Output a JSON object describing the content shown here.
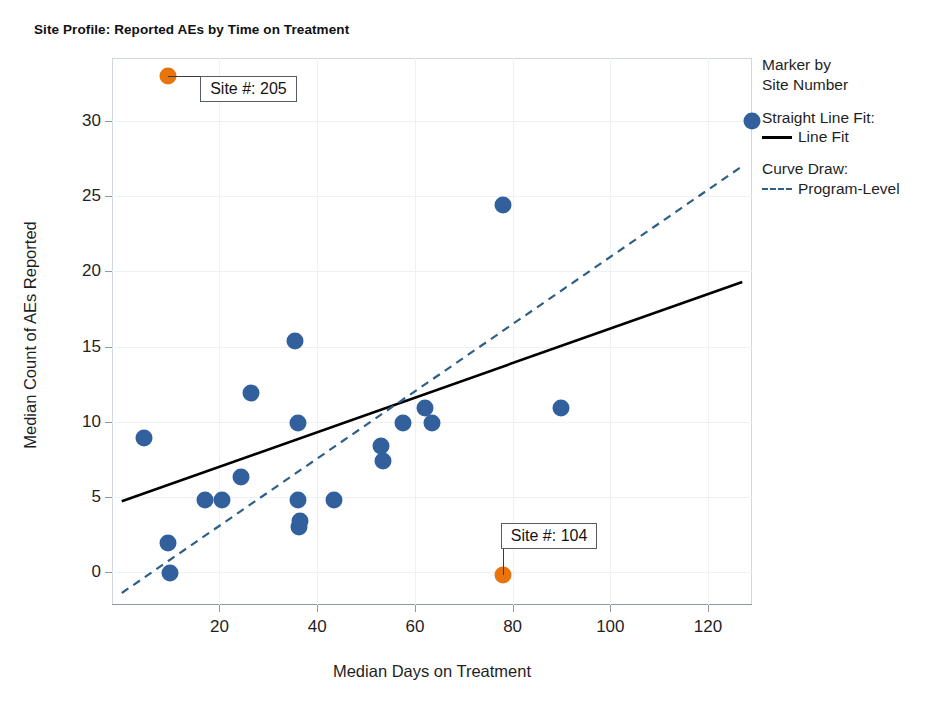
{
  "chart_data": {
    "type": "scatter",
    "title": "Site Profile: Reported AEs by Time on Treatment",
    "xlabel": "Median Days on Treatment",
    "ylabel": "Median Count of AEs Reported",
    "xlim": [
      -2,
      129
    ],
    "ylim": [
      -2.2,
      34.2
    ],
    "xticks": [
      20,
      40,
      60,
      80,
      100,
      120
    ],
    "yticks": [
      0,
      5,
      10,
      15,
      20,
      25,
      30
    ],
    "grid": true,
    "legend_position": "right",
    "colors": {
      "marker_default": "#31609D",
      "marker_highlight": "#E8740C",
      "line_fit": "#000000",
      "program_level": "#2F5F86",
      "grid": "#EEF1F4",
      "axis": "#8D99A6"
    },
    "series": [
      {
        "name": "Marker by Site Number",
        "color": "#31609D",
        "points": [
          {
            "x": 4.5,
            "y": 8.9
          },
          {
            "x": 9.5,
            "y": 1.9
          },
          {
            "x": 9.8,
            "y": -0.1
          },
          {
            "x": 17.0,
            "y": 4.8
          },
          {
            "x": 20.5,
            "y": 4.8
          },
          {
            "x": 24.5,
            "y": 6.3
          },
          {
            "x": 26.5,
            "y": 11.9
          },
          {
            "x": 35.5,
            "y": 15.4
          },
          {
            "x": 36.0,
            "y": 9.9
          },
          {
            "x": 36.0,
            "y": 4.8
          },
          {
            "x": 36.2,
            "y": 3.0
          },
          {
            "x": 36.5,
            "y": 3.4
          },
          {
            "x": 43.5,
            "y": 4.8
          },
          {
            "x": 53.0,
            "y": 8.4
          },
          {
            "x": 53.5,
            "y": 7.4
          },
          {
            "x": 57.5,
            "y": 9.9
          },
          {
            "x": 62.0,
            "y": 10.9
          },
          {
            "x": 63.5,
            "y": 9.9
          },
          {
            "x": 78.0,
            "y": 24.4
          },
          {
            "x": 90.0,
            "y": 10.9
          },
          {
            "x": 129.0,
            "y": 30.0
          }
        ]
      },
      {
        "name": "Highlighted Sites",
        "color": "#E8740C",
        "points": [
          {
            "x": 9.5,
            "y": 33.0,
            "label": "Site #: 205"
          },
          {
            "x": 78.0,
            "y": -0.2,
            "label": "Site #: 104"
          }
        ]
      }
    ],
    "lines": [
      {
        "name": "Line Fit",
        "style": "solid",
        "color": "#000000",
        "x0": 0.0,
        "y0": 4.7,
        "x1": 127.0,
        "y1": 19.3
      },
      {
        "name": "Program-Level",
        "style": "dashed",
        "color": "#2F5F86",
        "x0": 0.0,
        "y0": -1.4,
        "x1": 127.0,
        "y1": 27.0
      }
    ],
    "annotations": [
      {
        "text": "Site #: 205",
        "anchor_x": 9.5,
        "anchor_y": 33.0
      },
      {
        "text": "Site #: 104",
        "anchor_x": 78.0,
        "anchor_y": -0.2
      }
    ]
  },
  "legend": {
    "marker_heading_line1": "Marker by",
    "marker_heading_line2": "Site Number",
    "fit_heading": "Straight Line Fit:",
    "fit_label": "Line Fit",
    "curve_heading": "Curve Draw:",
    "curve_label": "Program-Level"
  },
  "annotations": {
    "site_205": "Site #: 205",
    "site_104": "Site #: 104"
  }
}
